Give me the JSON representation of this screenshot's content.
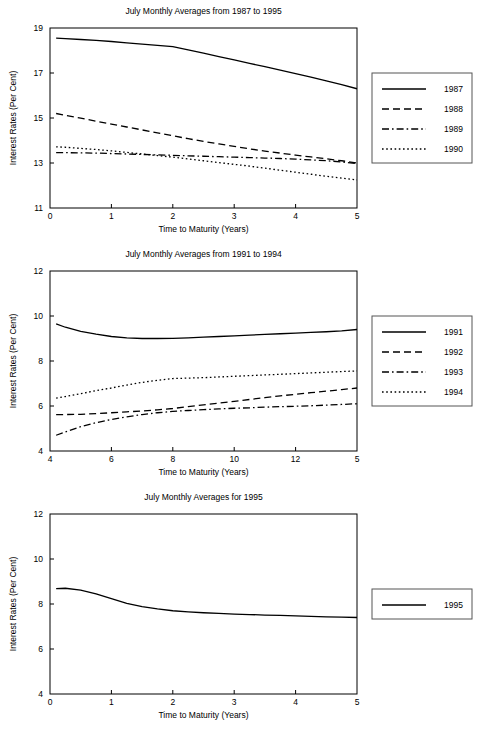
{
  "figure": {
    "axis_label_x": "Time to Maturity (Years)",
    "axis_label_y": "Interest Rates (Per Cent)",
    "line_color": "#000000",
    "frame_color": "#000000",
    "legend_border_color": "#555555"
  },
  "chart_data": [
    {
      "type": "line",
      "title": "July Monthly Averages from 1987 to 1995",
      "xlabel": "Time to Maturity (Years)",
      "ylabel": "Interest Rates (Per Cent)",
      "xlim": [
        0,
        5
      ],
      "ylim": [
        11,
        19
      ],
      "xticks": [
        0,
        1,
        2,
        3,
        4,
        5
      ],
      "yticks": [
        11,
        13,
        15,
        17,
        19
      ],
      "xtick_labels": [
        "0",
        "1",
        "2",
        "3",
        "4",
        "5"
      ],
      "ytick_labels": [
        "11",
        "13",
        "15",
        "17",
        "19"
      ],
      "grid": false,
      "legend_position": "right",
      "x": [
        0.1,
        0.25,
        0.5,
        0.75,
        1.0,
        1.25,
        1.5,
        1.75,
        2.0,
        2.25,
        2.5,
        2.75,
        3.0,
        3.25,
        3.5,
        3.75,
        4.0,
        4.25,
        4.5,
        4.75,
        5.0
      ],
      "series": [
        {
          "name": "1987",
          "dash": "solid",
          "values": [
            18.55,
            18.53,
            18.49,
            18.45,
            18.4,
            18.34,
            18.28,
            18.23,
            18.17,
            18.03,
            17.88,
            17.73,
            17.58,
            17.43,
            17.28,
            17.13,
            16.97,
            16.82,
            16.65,
            16.48,
            16.3
          ]
        },
        {
          "name": "1988",
          "dash": "dashed",
          "values": [
            15.2,
            15.12,
            14.99,
            14.86,
            14.73,
            14.6,
            14.47,
            14.34,
            14.21,
            14.08,
            13.96,
            13.85,
            13.74,
            13.63,
            13.53,
            13.44,
            13.35,
            13.27,
            13.19,
            13.1,
            13.0
          ]
        },
        {
          "name": "1989",
          "dash": "dashdot",
          "values": [
            13.46,
            13.46,
            13.45,
            13.44,
            13.42,
            13.4,
            13.38,
            13.36,
            13.34,
            13.32,
            13.3,
            13.28,
            13.26,
            13.24,
            13.22,
            13.2,
            13.17,
            13.14,
            13.1,
            13.05,
            12.97
          ]
        },
        {
          "name": "1990",
          "dash": "dotted",
          "values": [
            13.72,
            13.7,
            13.65,
            13.6,
            13.54,
            13.47,
            13.4,
            13.33,
            13.26,
            13.18,
            13.1,
            13.02,
            12.94,
            12.86,
            12.77,
            12.68,
            12.59,
            12.5,
            12.41,
            12.33,
            12.25
          ]
        }
      ],
      "legend": [
        {
          "label": "1987",
          "dash": "solid"
        },
        {
          "label": "1988",
          "dash": "dashed"
        },
        {
          "label": "1989",
          "dash": "dashdot"
        },
        {
          "label": "1990",
          "dash": "dotted"
        }
      ]
    },
    {
      "type": "line",
      "title": "July Monthly Averages from 1991 to 1994",
      "xlabel": "Time to Maturity (Years)",
      "ylabel": "Interest Rates (Per Cent)",
      "xlim": [
        0,
        5
      ],
      "ylim": [
        4,
        12
      ],
      "xticks": [
        0,
        1,
        2,
        3,
        4,
        5
      ],
      "yticks": [
        4,
        6,
        8,
        10,
        12
      ],
      "xtick_labels": [
        "4",
        "6",
        "8",
        "10",
        "12"
      ],
      "ytick_labels": [
        "4",
        "6",
        "8",
        "10",
        "12"
      ],
      "grid": false,
      "legend_position": "right",
      "x": [
        0.1,
        0.25,
        0.5,
        0.75,
        1.0,
        1.25,
        1.5,
        1.75,
        2.0,
        2.25,
        2.5,
        2.75,
        3.0,
        3.25,
        3.5,
        3.75,
        4.0,
        4.25,
        4.5,
        4.75,
        5.0
      ],
      "series": [
        {
          "name": "1991",
          "dash": "solid",
          "values": [
            9.65,
            9.5,
            9.32,
            9.19,
            9.09,
            9.03,
            9.0,
            9.0,
            9.01,
            9.03,
            9.06,
            9.09,
            9.12,
            9.15,
            9.18,
            9.21,
            9.24,
            9.27,
            9.3,
            9.34,
            9.4
          ]
        },
        {
          "name": "1992",
          "dash": "dashed",
          "values": [
            5.62,
            5.62,
            5.63,
            5.66,
            5.7,
            5.74,
            5.78,
            5.83,
            5.89,
            5.97,
            6.05,
            6.13,
            6.21,
            6.29,
            6.37,
            6.45,
            6.52,
            6.59,
            6.66,
            6.73,
            6.8
          ]
        },
        {
          "name": "1993",
          "dash": "dashdot",
          "values": [
            4.7,
            4.85,
            5.08,
            5.26,
            5.4,
            5.52,
            5.62,
            5.7,
            5.76,
            5.8,
            5.84,
            5.87,
            5.9,
            5.92,
            5.95,
            5.97,
            5.99,
            6.01,
            6.04,
            6.07,
            6.1
          ]
        },
        {
          "name": "1994",
          "dash": "dotted",
          "values": [
            6.35,
            6.42,
            6.55,
            6.68,
            6.8,
            6.93,
            7.05,
            7.14,
            7.22,
            7.24,
            7.26,
            7.29,
            7.32,
            7.35,
            7.38,
            7.41,
            7.44,
            7.47,
            7.5,
            7.53,
            7.56
          ]
        }
      ],
      "legend": [
        {
          "label": "1991",
          "dash": "solid"
        },
        {
          "label": "1992",
          "dash": "dashed"
        },
        {
          "label": "1993",
          "dash": "dashdot"
        },
        {
          "label": "1994",
          "dash": "dotted"
        }
      ]
    },
    {
      "type": "line",
      "title": "July Monthly Averages for 1995",
      "xlabel": "Time to Maturity (Years)",
      "ylabel": "Interest Rates (Per Cent)",
      "xlim": [
        0,
        5
      ],
      "ylim": [
        4,
        12
      ],
      "xticks": [
        0,
        1,
        2,
        3,
        4,
        5
      ],
      "yticks": [
        4,
        6,
        8,
        10,
        12
      ],
      "xtick_labels": [
        "0",
        "1",
        "2",
        "3",
        "4",
        "5"
      ],
      "ytick_labels": [
        "4",
        "6",
        "8",
        "10",
        "12"
      ],
      "grid": false,
      "legend_position": "right",
      "x": [
        0.1,
        0.25,
        0.5,
        0.75,
        1.0,
        1.25,
        1.5,
        1.75,
        2.0,
        2.25,
        2.5,
        2.75,
        3.0,
        3.25,
        3.5,
        3.75,
        4.0,
        4.25,
        4.5,
        4.75,
        5.0
      ],
      "series": [
        {
          "name": "1995",
          "dash": "solid",
          "values": [
            8.68,
            8.7,
            8.62,
            8.45,
            8.24,
            8.03,
            7.88,
            7.78,
            7.7,
            7.65,
            7.61,
            7.58,
            7.55,
            7.53,
            7.51,
            7.49,
            7.47,
            7.45,
            7.43,
            7.42,
            7.4
          ]
        }
      ],
      "legend": [
        {
          "label": "1995",
          "dash": "solid"
        }
      ]
    }
  ]
}
